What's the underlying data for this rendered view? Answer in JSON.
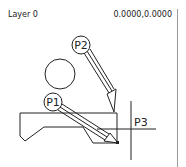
{
  "status": {
    "layer_label": "Layer 0",
    "coordinates": "0.0000,0.0000"
  },
  "drawing": {
    "labels": {
      "p1": "P1",
      "p2": "P2",
      "p3": "P3"
    },
    "stroke_color": "#222222",
    "divider_color": "#9a9a9a"
  }
}
